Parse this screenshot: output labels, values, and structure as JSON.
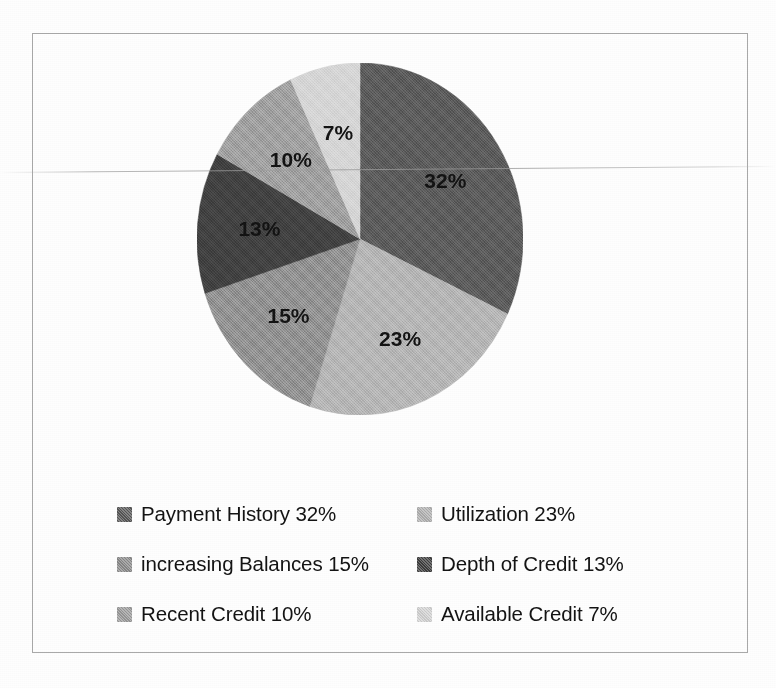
{
  "chart_data": {
    "type": "pie",
    "title": "",
    "subtitle": "",
    "xlabel": "",
    "ylabel": "",
    "grid": false,
    "legend_position": "bottom",
    "start_angle_deg": 0,
    "direction": "clockwise",
    "units": "percent",
    "total": 100,
    "categories": [
      "Payment History",
      "Utilization",
      "increasing Balances",
      "Depth of Credit",
      "Recent Credit",
      "Available Credit"
    ],
    "values": [
      32,
      23,
      15,
      13,
      10,
      7
    ],
    "data_labels": [
      "32%",
      "23%",
      "15%",
      "13%",
      "10%",
      "7%"
    ],
    "colors": [
      "#585858",
      "#b2b2b2",
      "#8c8c8c",
      "#3f3f3f",
      "#9c9c9c",
      "#d4d4d4"
    ],
    "slices": [
      {
        "label": "Payment History",
        "value": 32,
        "data_label": "32%",
        "color": "#585858"
      },
      {
        "label": "Utilization",
        "value": 23,
        "data_label": "23%",
        "color": "#b2b2b2"
      },
      {
        "label": "increasing Balances",
        "value": 15,
        "data_label": "15%",
        "color": "#8c8c8c"
      },
      {
        "label": "Depth of Credit",
        "value": 13,
        "data_label": "13%",
        "color": "#3f3f3f"
      },
      {
        "label": "Recent Credit",
        "value": 10,
        "data_label": "10%",
        "color": "#9c9c9c"
      },
      {
        "label": "Available Credit",
        "value": 7,
        "data_label": "7%",
        "color": "#d4d4d4"
      }
    ]
  },
  "legend": {
    "items": [
      {
        "text": "Payment History 32%",
        "color": "#585858"
      },
      {
        "text": "Utilization 23%",
        "color": "#b2b2b2"
      },
      {
        "text": "increasing Balances 15%",
        "color": "#8c8c8c"
      },
      {
        "text": "Depth of Credit 13%",
        "color": "#3f3f3f"
      },
      {
        "text": "Recent Credit 10%",
        "color": "#9c9c9c"
      },
      {
        "text": "Available Credit 7%",
        "color": "#d4d4d4"
      }
    ]
  },
  "frame": {
    "border_color": "#a9a9a9",
    "background": "#ffffff"
  }
}
